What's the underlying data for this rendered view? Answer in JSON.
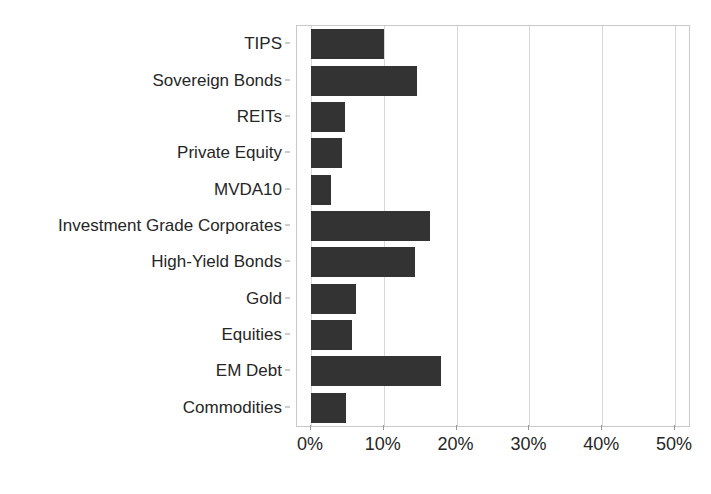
{
  "chart_data": {
    "type": "bar",
    "orientation": "horizontal",
    "title": "",
    "subtitle": "",
    "xlabel": "",
    "ylabel": "",
    "xlim": [
      0,
      50
    ],
    "ylim": null,
    "grid": true,
    "legend": null,
    "legend_position": "none",
    "bar_color": "#333333",
    "categories": [
      "TIPS",
      "Sovereign Bonds",
      "REITs",
      "Private Equity",
      "MVDA10",
      "Investment Grade Corporates",
      "High-Yield Bonds",
      "Gold",
      "Equities",
      "EM Debt",
      "Commodities"
    ],
    "values": [
      10.0,
      14.5,
      4.7,
      4.2,
      2.7,
      16.3,
      14.3,
      6.2,
      5.6,
      17.8,
      4.8
    ],
    "xticks": [
      0,
      10,
      20,
      30,
      40,
      50
    ],
    "xticklabels": [
      "0%",
      "10%",
      "20%",
      "30%",
      "40%",
      "50%"
    ],
    "value_format": "percent",
    "annotations": []
  }
}
